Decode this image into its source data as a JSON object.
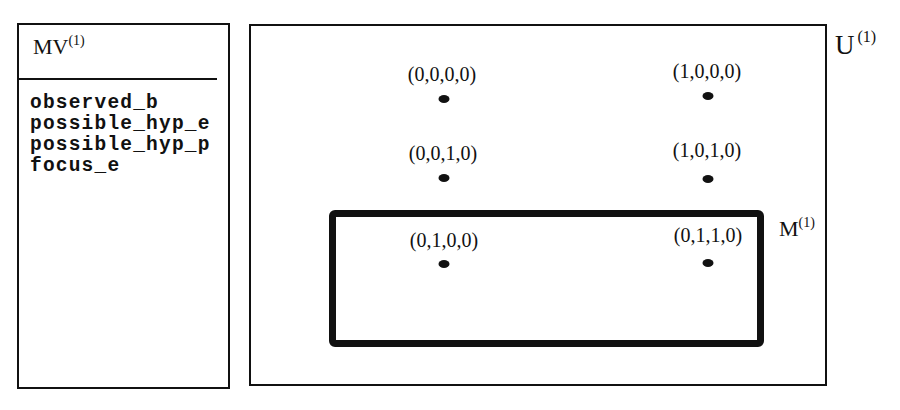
{
  "mv_panel": {
    "title": "MV",
    "title_superscript": "(1)",
    "variables": [
      "observed_b",
      "possible_hyp_e",
      "possible_hyp_p",
      "focus_e"
    ]
  },
  "universe": {
    "label": "U",
    "label_superscript": "(1)"
  },
  "model": {
    "label": "M",
    "label_superscript": "(1)"
  },
  "points": [
    {
      "label": "(0,0,0,0)",
      "in_model": false
    },
    {
      "label": "(1,0,0,0)",
      "in_model": false
    },
    {
      "label": "(0,0,1,0)",
      "in_model": false
    },
    {
      "label": "(1,0,1,0)",
      "in_model": false
    },
    {
      "label": "(0,1,0,0)",
      "in_model": true
    },
    {
      "label": "(0,1,1,0)",
      "in_model": true
    }
  ],
  "colors": {
    "stroke": "#111111",
    "background": "#ffffff"
  }
}
